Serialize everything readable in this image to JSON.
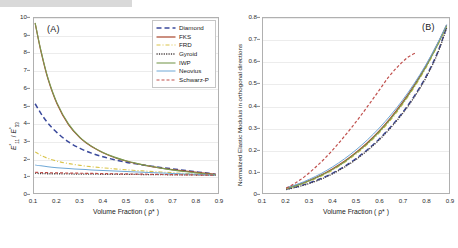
{
  "figure": {
    "panels": [
      {
        "tag": "(A)"
      },
      {
        "tag": "(B)"
      }
    ]
  },
  "legend": {
    "entries": [
      {
        "label": "Diamond",
        "color": "#3b4a9c",
        "dash": "5,3",
        "width": 1.5
      },
      {
        "label": "FKS",
        "color": "#a8442a",
        "dash": "none",
        "width": 1.2
      },
      {
        "label": "FRD",
        "color": "#d9c44a",
        "dash": "4,2,1,2",
        "width": 1.1
      },
      {
        "label": "Gyroid",
        "color": "#4a4040",
        "dash": "1.2,1.2",
        "width": 1.3
      },
      {
        "label": "IWP",
        "color": "#7a9b52",
        "dash": "none",
        "width": 1.1
      },
      {
        "label": "Neovius",
        "color": "#6fa8d6",
        "dash": "none",
        "width": 1.0
      },
      {
        "label": "Schwarz-P",
        "color": "#c0504d",
        "dash": "3,2",
        "width": 1.2
      }
    ]
  },
  "chart_data": [
    {
      "type": "line",
      "panel": "(A)",
      "title": "",
      "xlabel": "Volume Fraction ( ρ* )",
      "ylabel": "E*₁₁ / E*₃₃",
      "xlim": [
        0.1,
        0.9
      ],
      "ylim": [
        0,
        10
      ],
      "xticks": [
        0.1,
        0.2,
        0.3,
        0.4,
        0.5,
        0.6,
        0.7,
        0.8,
        0.9
      ],
      "xticklabels": [
        "0.1",
        "0.2",
        "0.3",
        "0.4",
        "0.5",
        "0.6",
        "0.7",
        "0.8",
        "0.9"
      ],
      "yticks": [
        0,
        1,
        2,
        3,
        4,
        5,
        6,
        7,
        8,
        9,
        10
      ],
      "yticklabels": [
        "0",
        "1",
        "2",
        "3",
        "4",
        "5",
        "6",
        "7",
        "8",
        "9",
        "10"
      ],
      "grid": "horizontal",
      "legend_position": "top-right",
      "series": [
        {
          "name": "Diamond",
          "x": [
            0.105,
            0.13,
            0.16,
            0.2,
            0.25,
            0.3,
            0.35,
            0.4,
            0.45,
            0.5,
            0.55,
            0.6,
            0.65,
            0.7,
            0.75,
            0.8,
            0.85,
            0.89
          ],
          "values": [
            5.1,
            4.55,
            4.0,
            3.45,
            2.92,
            2.55,
            2.28,
            2.07,
            1.9,
            1.76,
            1.65,
            1.55,
            1.46,
            1.38,
            1.3,
            1.22,
            1.14,
            1.07
          ]
        },
        {
          "name": "FKS",
          "x": [
            0.105,
            0.13,
            0.16,
            0.2,
            0.25,
            0.3,
            0.35,
            0.4,
            0.45,
            0.5,
            0.55,
            0.6,
            0.65,
            0.7,
            0.75,
            0.8,
            0.85,
            0.89
          ],
          "values": [
            9.7,
            8.1,
            6.55,
            5.1,
            3.9,
            3.15,
            2.65,
            2.3,
            2.03,
            1.83,
            1.67,
            1.54,
            1.43,
            1.34,
            1.26,
            1.19,
            1.12,
            1.06
          ]
        },
        {
          "name": "FRD",
          "x": [
            0.105,
            0.13,
            0.16,
            0.2,
            0.25,
            0.3,
            0.35,
            0.4,
            0.45,
            0.5,
            0.55,
            0.6,
            0.65,
            0.7,
            0.75,
            0.8,
            0.85,
            0.89
          ],
          "values": [
            2.35,
            2.15,
            1.98,
            1.82,
            1.68,
            1.58,
            1.5,
            1.44,
            1.38,
            1.33,
            1.28,
            1.24,
            1.2,
            1.16,
            1.12,
            1.09,
            1.05,
            1.02
          ]
        },
        {
          "name": "Gyroid",
          "x": [
            0.105,
            0.13,
            0.16,
            0.2,
            0.25,
            0.3,
            0.35,
            0.4,
            0.45,
            0.5,
            0.55,
            0.6,
            0.65,
            0.7,
            0.75,
            0.8,
            0.85,
            0.89
          ],
          "values": [
            1.12,
            1.11,
            1.1,
            1.1,
            1.09,
            1.08,
            1.08,
            1.07,
            1.07,
            1.06,
            1.06,
            1.05,
            1.05,
            1.04,
            1.04,
            1.03,
            1.02,
            1.01
          ]
        },
        {
          "name": "IWP",
          "x": [
            0.105,
            0.13,
            0.16,
            0.2,
            0.25,
            0.3,
            0.35,
            0.4,
            0.45,
            0.5,
            0.55,
            0.6,
            0.65,
            0.7,
            0.75,
            0.8,
            0.85,
            0.89
          ],
          "values": [
            9.72,
            8.15,
            6.6,
            5.15,
            3.95,
            3.18,
            2.68,
            2.32,
            2.05,
            1.84,
            1.68,
            1.54,
            1.42,
            1.32,
            1.23,
            1.16,
            1.09,
            1.04
          ]
        },
        {
          "name": "Neovius",
          "x": [
            0.105,
            0.13,
            0.16,
            0.2,
            0.25,
            0.3,
            0.35,
            0.4,
            0.45,
            0.5,
            0.55,
            0.6,
            0.65,
            0.7,
            0.75,
            0.8,
            0.85,
            0.89
          ],
          "values": [
            1.6,
            1.55,
            1.5,
            1.45,
            1.4,
            1.36,
            1.32,
            1.29,
            1.26,
            1.23,
            1.2,
            1.17,
            1.14,
            1.12,
            1.09,
            1.07,
            1.04,
            1.02
          ]
        },
        {
          "name": "Schwarz-P",
          "x": [
            0.105,
            0.13,
            0.16,
            0.2,
            0.25,
            0.3,
            0.35,
            0.4,
            0.45,
            0.5,
            0.55,
            0.6,
            0.65,
            0.7,
            0.75,
            0.8,
            0.85,
            0.89
          ],
          "values": [
            1.18,
            1.17,
            1.16,
            1.15,
            1.14,
            1.13,
            1.12,
            1.11,
            1.1,
            1.09,
            1.08,
            1.07,
            1.06,
            1.05,
            1.04,
            1.03,
            1.02,
            1.01
          ]
        }
      ]
    },
    {
      "type": "line",
      "panel": "(B)",
      "title": "",
      "xlabel": "Volume Fraction ( ρ* )",
      "ylabel": "Normalized Elastic Modulus in orthogonal directions",
      "xlim": [
        0.1,
        0.9
      ],
      "ylim": [
        0,
        0.8
      ],
      "xticks": [
        0.1,
        0.2,
        0.3,
        0.4,
        0.5,
        0.6,
        0.7,
        0.8,
        0.9
      ],
      "xticklabels": [
        "0.1",
        "0.2",
        "0.3",
        "0.4",
        "0.5",
        "0.6",
        "0.7",
        "0.8",
        "0.9"
      ],
      "yticks": [
        0,
        0.1,
        0.2,
        0.3,
        0.4,
        0.5,
        0.6,
        0.7,
        0.8
      ],
      "yticklabels": [
        "0",
        "0.1",
        "0.2",
        "0.3",
        "0.4",
        "0.5",
        "0.6",
        "0.7",
        "0.8"
      ],
      "grid": "horizontal",
      "legend_position": "top-left",
      "series": [
        {
          "name": "Diamond",
          "x": [
            0.2,
            0.25,
            0.3,
            0.35,
            0.4,
            0.45,
            0.5,
            0.55,
            0.6,
            0.65,
            0.7,
            0.75,
            0.8,
            0.85,
            0.89
          ],
          "values": [
            0.018,
            0.03,
            0.046,
            0.066,
            0.091,
            0.121,
            0.157,
            0.199,
            0.247,
            0.303,
            0.367,
            0.442,
            0.53,
            0.64,
            0.76
          ]
        },
        {
          "name": "FKS",
          "x": [
            0.2,
            0.25,
            0.3,
            0.35,
            0.4,
            0.45,
            0.5,
            0.55,
            0.6,
            0.65,
            0.7,
            0.75,
            0.8,
            0.85,
            0.89
          ],
          "values": [
            0.022,
            0.038,
            0.058,
            0.082,
            0.111,
            0.145,
            0.185,
            0.231,
            0.284,
            0.345,
            0.414,
            0.492,
            0.58,
            0.68,
            0.768
          ]
        },
        {
          "name": "FRD",
          "x": [
            0.2,
            0.25,
            0.3,
            0.35,
            0.4,
            0.45,
            0.5,
            0.55,
            0.6,
            0.65,
            0.7,
            0.75,
            0.8,
            0.85,
            0.89
          ],
          "values": [
            0.02,
            0.035,
            0.054,
            0.077,
            0.105,
            0.139,
            0.178,
            0.223,
            0.275,
            0.335,
            0.404,
            0.482,
            0.57,
            0.672,
            0.762
          ]
        },
        {
          "name": "Gyroid",
          "x": [
            0.2,
            0.25,
            0.3,
            0.35,
            0.4,
            0.45,
            0.5,
            0.55,
            0.6,
            0.65,
            0.7,
            0.75,
            0.8,
            0.85,
            0.89
          ],
          "values": [
            0.016,
            0.028,
            0.044,
            0.063,
            0.088,
            0.118,
            0.153,
            0.195,
            0.243,
            0.299,
            0.363,
            0.437,
            0.525,
            0.635,
            0.755
          ]
        },
        {
          "name": "IWP",
          "x": [
            0.2,
            0.25,
            0.3,
            0.35,
            0.4,
            0.45,
            0.5,
            0.55,
            0.6,
            0.65,
            0.7,
            0.75,
            0.8,
            0.85,
            0.89
          ],
          "values": [
            0.021,
            0.036,
            0.056,
            0.08,
            0.108,
            0.142,
            0.182,
            0.227,
            0.28,
            0.34,
            0.409,
            0.487,
            0.575,
            0.676,
            0.765
          ]
        },
        {
          "name": "Neovius",
          "x": [
            0.2,
            0.25,
            0.3,
            0.35,
            0.4,
            0.45,
            0.5,
            0.55,
            0.6,
            0.65,
            0.7,
            0.75,
            0.8,
            0.85,
            0.89
          ],
          "values": [
            0.024,
            0.041,
            0.063,
            0.089,
            0.12,
            0.156,
            0.197,
            0.244,
            0.297,
            0.357,
            0.424,
            0.5,
            0.585,
            0.683,
            0.77
          ]
        },
        {
          "name": "Schwarz-P",
          "x": [
            0.2,
            0.24,
            0.28,
            0.32,
            0.36,
            0.4,
            0.44,
            0.48,
            0.52,
            0.56,
            0.6,
            0.64,
            0.68,
            0.72,
            0.755
          ],
          "values": [
            0.022,
            0.046,
            0.076,
            0.112,
            0.152,
            0.197,
            0.246,
            0.298,
            0.353,
            0.411,
            0.47,
            0.53,
            0.578,
            0.618,
            0.64
          ]
        }
      ]
    }
  ]
}
